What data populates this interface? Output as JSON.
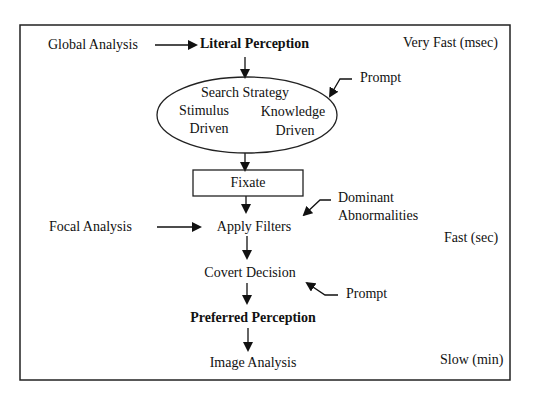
{
  "diagram": {
    "left_labels": {
      "global_analysis": "Global Analysis",
      "focal_analysis": "Focal Analysis"
    },
    "flow": {
      "literal_perception": "Literal Perception",
      "search_strategy": {
        "title": "Search Strategy",
        "stimulus": "Stimulus",
        "stimulus_driven": "Driven",
        "knowledge": "Knowledge",
        "knowledge_driven": "Driven"
      },
      "fixate": "Fixate",
      "apply_filters": "Apply Filters",
      "covert_decision": "Covert Decision",
      "preferred_perception": "Preferred Perception",
      "image_analysis": "Image Analysis"
    },
    "right_labels": {
      "prompt_1": "Prompt",
      "dominant": "Dominant",
      "abnormalities": "Abnormalities",
      "prompt_2": "Prompt"
    },
    "timescales": {
      "very_fast": "Very Fast (msec)",
      "fast": "Fast (sec)",
      "slow": "Slow (min)"
    }
  }
}
